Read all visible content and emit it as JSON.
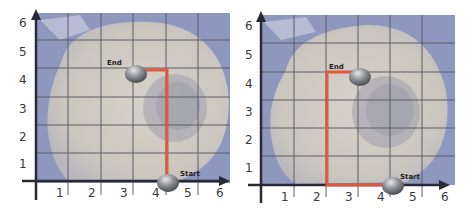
{
  "colors": {
    "sea": "#8e97bd",
    "land": "#cfcbc3",
    "land_dark": "#a7a5b0",
    "grid": "#5c5c66",
    "axis": "#2a2a35",
    "path": "#e0593f",
    "marker": "#8a8c90"
  },
  "panels": [
    {
      "id": "left",
      "x_ticks": [
        "1",
        "2",
        "3",
        "4",
        "5",
        "6"
      ],
      "y_ticks": [
        "1",
        "2",
        "3",
        "4",
        "5",
        "6"
      ],
      "start_label": "Start",
      "end_label": "End",
      "start_point": [
        4.2,
        0
      ],
      "end_point": [
        3.2,
        4
      ],
      "path": [
        [
          4.2,
          0
        ],
        [
          4.2,
          4
        ],
        [
          3.2,
          4
        ]
      ]
    },
    {
      "id": "right",
      "x_ticks": [
        "1",
        "2",
        "3",
        "4",
        "5",
        "6"
      ],
      "y_ticks": [
        "1",
        "2",
        "3",
        "4",
        "5",
        "6"
      ],
      "start_label": "Start",
      "end_label": "End",
      "start_point": [
        4.2,
        0
      ],
      "end_point": [
        3.2,
        4
      ],
      "path": [
        [
          4.2,
          0
        ],
        [
          2.0,
          0
        ],
        [
          2.0,
          4
        ],
        [
          3.2,
          4
        ]
      ]
    }
  ]
}
